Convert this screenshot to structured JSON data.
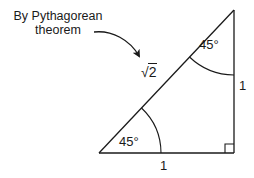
{
  "diagram": {
    "annotation": {
      "line1": "By Pythagorean",
      "line2": "theorem"
    },
    "labels": {
      "angle_top": "45°",
      "angle_bottom_left": "45°",
      "side_vertical": "1",
      "side_horizontal": "1",
      "hypotenuse_radical": "√",
      "hypotenuse_radicand": "2"
    },
    "geometry": {
      "vertices": {
        "bottom_left": [
          99,
          153
        ],
        "bottom_right": [
          234,
          153
        ],
        "top": [
          234,
          10
        ]
      },
      "right_angle_marker_size": 9
    },
    "colors": {
      "line": "#1a1a1a",
      "text": "#1a1a1a",
      "background": "#ffffff"
    }
  }
}
